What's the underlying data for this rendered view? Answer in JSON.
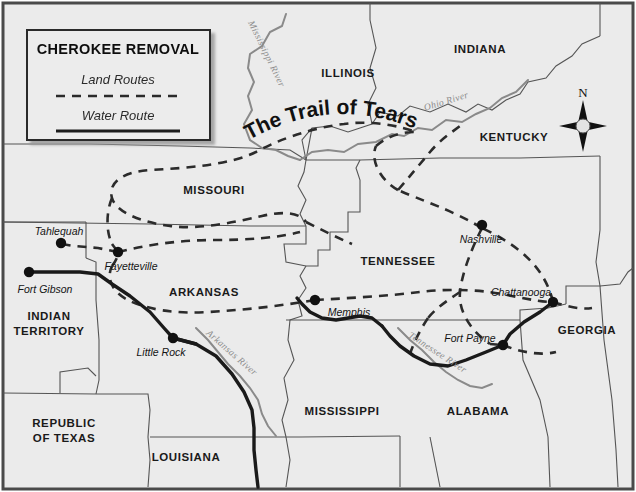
{
  "map": {
    "title": "The Trail of Tears",
    "background_color": "#ebebeb",
    "frame_color": "#4a4a4a",
    "land_route_color": "#2b2b2b",
    "water_route_color": "#1a1a1a",
    "border_color": "#555555",
    "river_color": "#8a8a8a"
  },
  "legend": {
    "title": "CHEROKEE REMOVAL",
    "items": [
      {
        "label": "Land Routes",
        "style": "dashed"
      },
      {
        "label": "Water Route",
        "style": "solid"
      }
    ]
  },
  "compass": {
    "north_label": "N"
  },
  "states": [
    {
      "name": "ILLINOIS",
      "x": 348,
      "y": 77
    },
    {
      "name": "INDIANA",
      "x": 480,
      "y": 53
    },
    {
      "name": "KENTUCKY",
      "x": 514,
      "y": 141
    },
    {
      "name": "MISSOURI",
      "x": 214,
      "y": 194
    },
    {
      "name": "TENNESSEE",
      "x": 398,
      "y": 265
    },
    {
      "name": "ARKANSAS",
      "x": 204,
      "y": 296
    },
    {
      "name": "GEORGIA",
      "x": 587,
      "y": 334
    },
    {
      "name": "ALABAMA",
      "x": 478,
      "y": 415
    },
    {
      "name": "MISSISSIPPI",
      "x": 342,
      "y": 415
    },
    {
      "name": "LOUISIANA",
      "x": 186,
      "y": 461
    }
  ],
  "states_multiline": [
    {
      "lines": [
        "INDIAN",
        "TERRITORY"
      ],
      "x": 49,
      "y": 320
    },
    {
      "lines": [
        "REPUBLIC",
        "OF TEXAS"
      ],
      "x": 64,
      "y": 427
    }
  ],
  "cities": [
    {
      "name": "Tahlequah",
      "dot_x": 61,
      "dot_y": 243,
      "label_x": 59,
      "label_y": 235
    },
    {
      "name": "Fayetteville",
      "dot_x": 118,
      "dot_y": 252,
      "label_x": 131,
      "label_y": 270
    },
    {
      "name": "Fort Gibson",
      "dot_x": 29,
      "dot_y": 272,
      "label_x": 45,
      "label_y": 293
    },
    {
      "name": "Little Rock",
      "dot_x": 173,
      "dot_y": 338,
      "label_x": 161,
      "label_y": 356
    },
    {
      "name": "Memphis",
      "dot_x": 315,
      "dot_y": 300,
      "label_x": 349,
      "label_y": 316
    },
    {
      "name": "Nashville",
      "dot_x": 482,
      "dot_y": 225,
      "label_x": 481,
      "label_y": 243
    },
    {
      "name": "Chattanooga",
      "dot_x": 553,
      "dot_y": 302,
      "label_x": 521,
      "label_y": 296
    },
    {
      "name": "Fort Payne",
      "dot_x": 503,
      "dot_y": 345,
      "label_x": 470,
      "label_y": 342
    }
  ],
  "rivers": [
    {
      "name": "Mississippi River",
      "x": 264,
      "y": 55,
      "rotate": 64
    },
    {
      "name": "Ohio River",
      "x": 447,
      "y": 104,
      "rotate": -17
    },
    {
      "name": "Arkansas River",
      "x": 230,
      "y": 355,
      "rotate": 41
    },
    {
      "name": "Tennessee River",
      "x": 436,
      "y": 355,
      "rotate": 33
    }
  ]
}
